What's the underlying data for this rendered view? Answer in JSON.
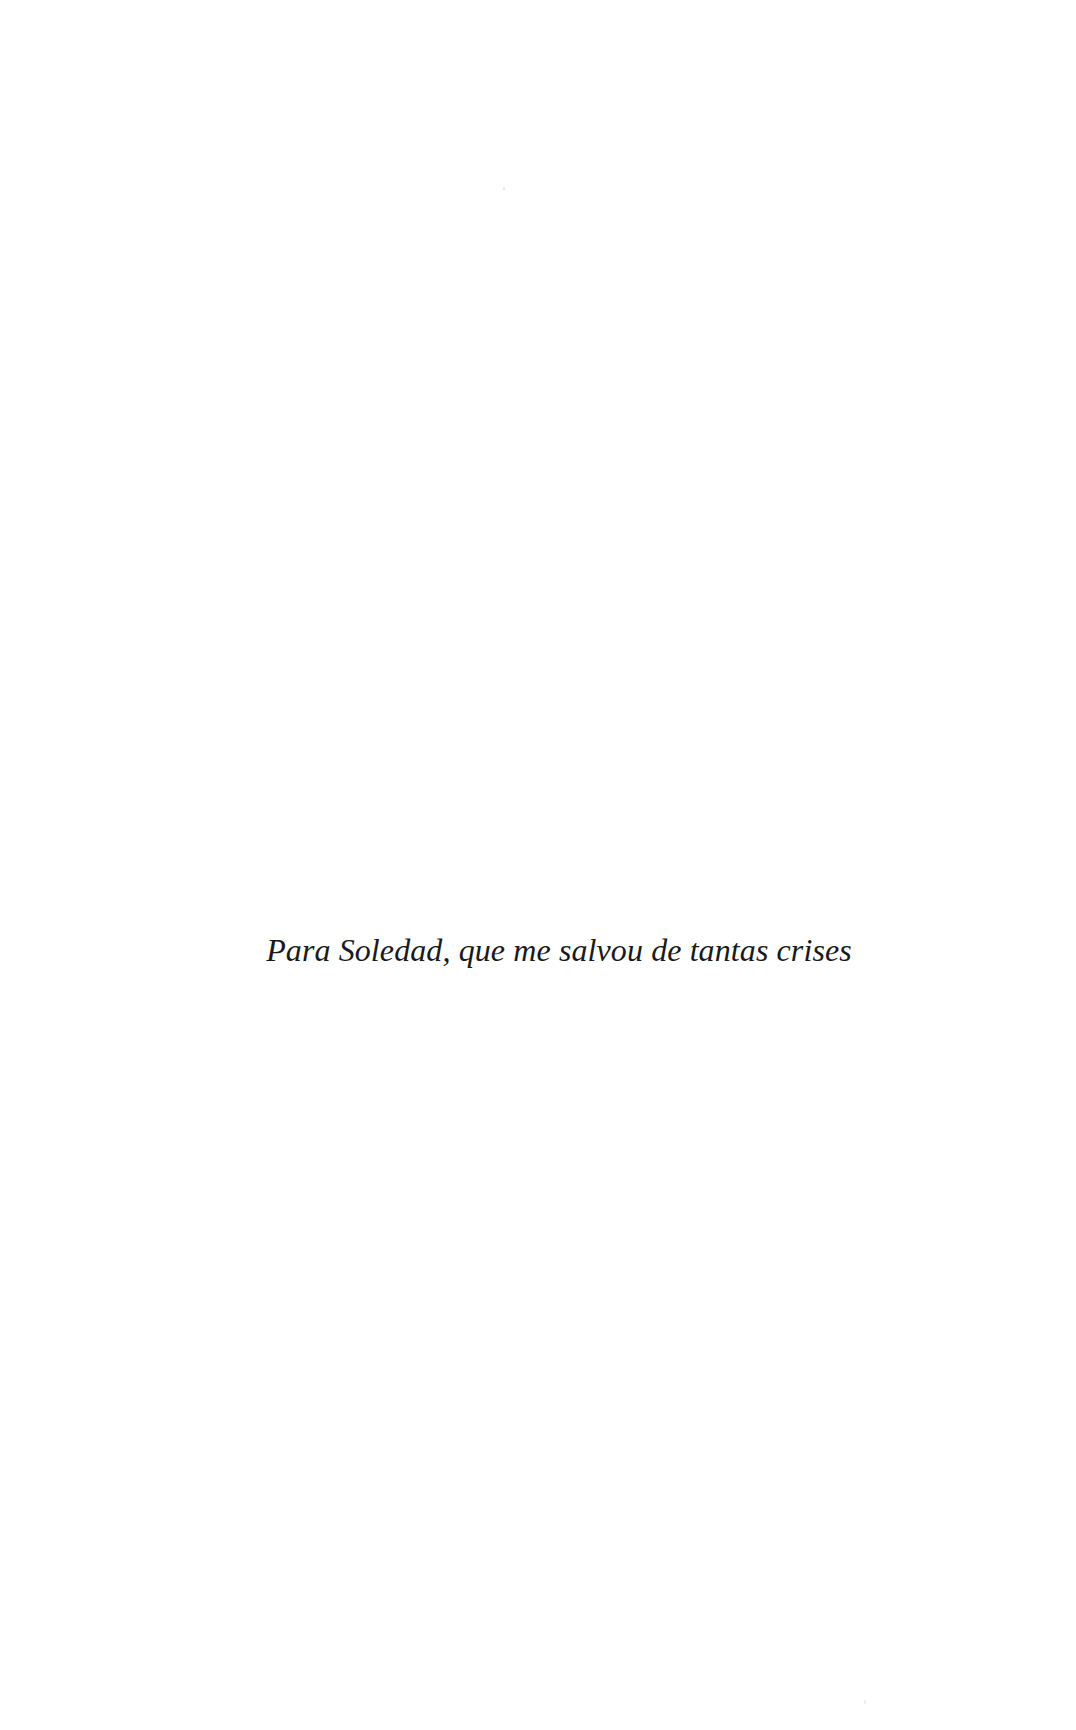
{
  "page": {
    "kind": "book-dedication-page",
    "background_color": "#ffffff",
    "width": 1076,
    "height": 1730
  },
  "dedication": {
    "text": "Para Soledad, que me salvou de tantas crises",
    "color": "#1a1a1a",
    "style": "italic-serif",
    "alignment": "center"
  },
  "artifacts": {
    "speck_top": "",
    "speck_bottom": ""
  }
}
